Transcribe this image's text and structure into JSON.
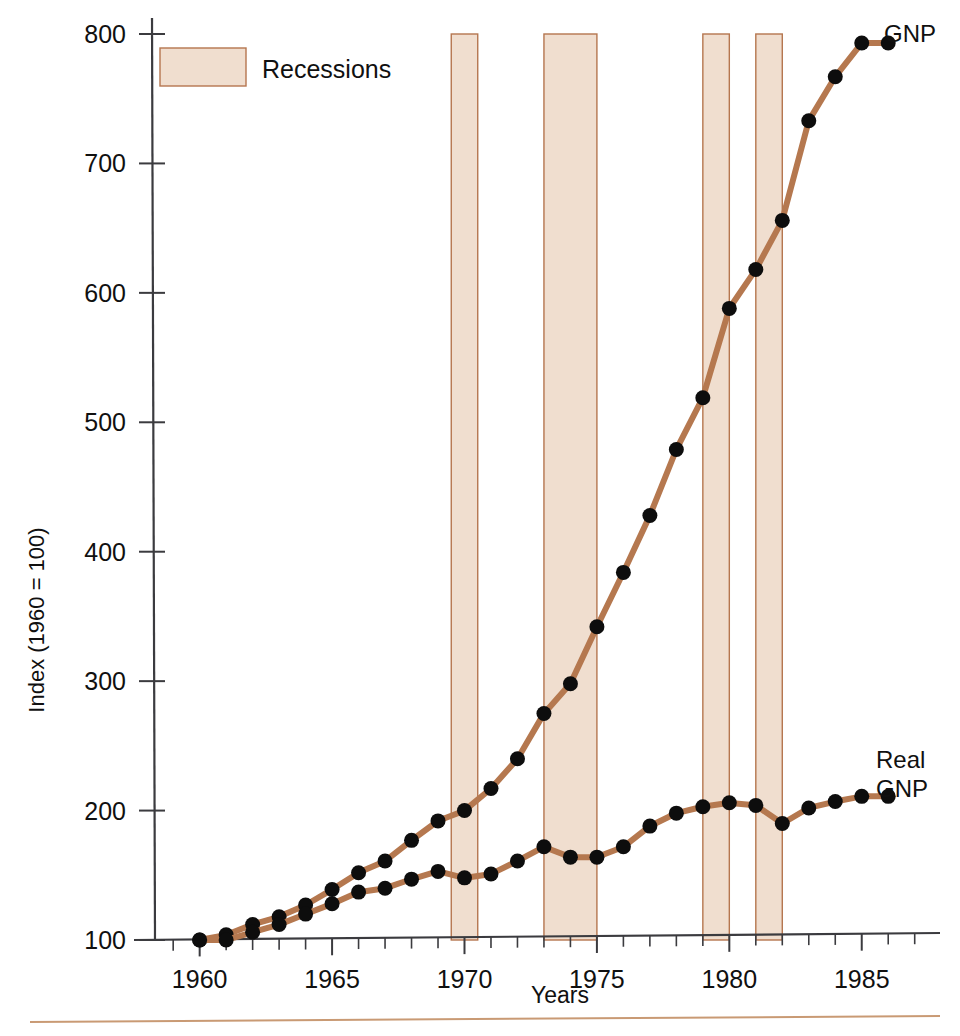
{
  "chart_data": {
    "type": "line",
    "title": "",
    "xlabel": "Years",
    "ylabel": "Index (1960 = 100)",
    "xlim": [
      1958.2,
      1987.2
    ],
    "ylim": [
      100,
      800
    ],
    "xticks": [
      1960,
      1965,
      1970,
      1975,
      1980,
      1985
    ],
    "xtick_labels": [
      "1960",
      "1965",
      "1970",
      "1975",
      "1980",
      "1985"
    ],
    "xtick_minor_step": 1,
    "yticks": [
      100,
      200,
      300,
      400,
      500,
      600,
      700,
      800
    ],
    "ytick_labels": [
      "100",
      "200",
      "300",
      "400",
      "500",
      "600",
      "700",
      "800"
    ],
    "grid": false,
    "legend_position": "upper-left-inside",
    "legend_entries": [
      "Recessions"
    ],
    "x": [
      1960,
      1961,
      1962,
      1963,
      1964,
      1965,
      1966,
      1967,
      1968,
      1969,
      1970,
      1971,
      1972,
      1973,
      1974,
      1975,
      1976,
      1977,
      1978,
      1979,
      1980,
      1981,
      1982,
      1983,
      1984,
      1985,
      1986
    ],
    "series": [
      {
        "name": "GNP",
        "label": "GNP",
        "color": "#b5784f",
        "marker": "filled-circle",
        "marker_color": "#0d0d0d",
        "values": [
          100,
          104,
          112,
          118,
          127,
          139,
          152,
          161,
          177,
          192,
          200,
          217,
          240,
          275,
          298,
          342,
          384,
          428,
          479,
          519,
          588,
          618,
          656,
          733,
          767,
          793,
          793
        ]
      },
      {
        "name": "Real GNP",
        "label": "Real\nGNP",
        "label_line1": "Real",
        "label_line2": "GNP",
        "color": "#b5784f",
        "marker": "filled-circle",
        "marker_color": "#0d0d0d",
        "values": [
          100,
          100,
          106,
          112,
          120,
          128,
          137,
          140,
          147,
          153,
          148,
          151,
          161,
          172,
          164,
          164,
          172,
          188,
          198,
          203,
          206,
          204,
          190,
          202,
          207,
          211,
          211
        ]
      }
    ],
    "bands": [
      {
        "label": "Recession 1969-1970",
        "start": 1969.5,
        "end": 1970.5,
        "fill": "#f0decf",
        "border": "#b5764f"
      },
      {
        "label": "Recession 1973-1975",
        "start": 1973.0,
        "end": 1975.0,
        "fill": "#f0decf",
        "border": "#b5764f"
      },
      {
        "label": "Recession 1979-1980",
        "start": 1979.0,
        "end": 1980.0,
        "fill": "#f0decf",
        "border": "#b5764f"
      },
      {
        "label": "Recession 1981-1982",
        "start": 1981.0,
        "end": 1982.0,
        "fill": "#f0decf",
        "border": "#b5764f"
      }
    ],
    "colors": {
      "band_fill": "#f0decf",
      "band_border": "#b5764f",
      "line": "#b5784f",
      "marker": "#0d0d0d",
      "axis": "#3b3b3f",
      "text": "#101010",
      "footer_rule": "#c99a74"
    }
  },
  "axes": {
    "y_axis_title": "Index (1960 = 100)",
    "x_axis_title": "Years"
  },
  "legend": {
    "recessions_label": "Recessions"
  },
  "annotations": {
    "gnp_label": "GNP",
    "real_gnp_label_line1": "Real",
    "real_gnp_label_line2": "GNP"
  }
}
